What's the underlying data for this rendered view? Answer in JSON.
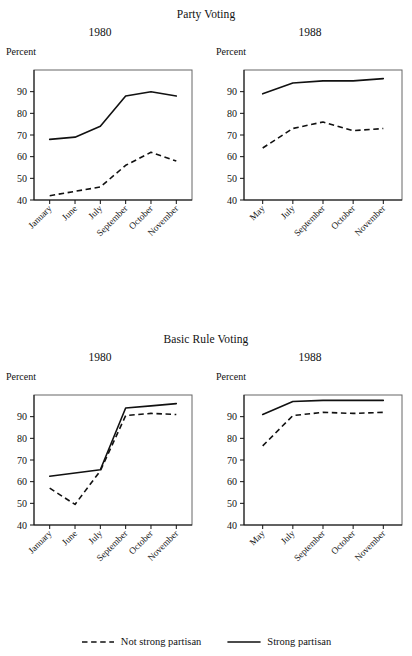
{
  "figure": {
    "panels": [
      {
        "title": "Party Voting",
        "charts": [
          {
            "year": "1980",
            "axis_label": "Percent"
          },
          {
            "year": "1988",
            "axis_label": "Percent"
          }
        ]
      },
      {
        "title": "Basic Rule Voting",
        "charts": [
          {
            "year": "1980",
            "axis_label": "Percent"
          },
          {
            "year": "1988",
            "axis_label": "Percent"
          }
        ]
      }
    ],
    "legend": {
      "items": [
        {
          "label": "Not strong partisan",
          "style": "dashed"
        },
        {
          "label": "Strong partisan",
          "style": "solid"
        }
      ]
    }
  },
  "chart_data": [
    {
      "id": "party-voting-1980",
      "type": "line",
      "title": "Party Voting",
      "subtitle": "1980",
      "xlabel": "",
      "ylabel": "Percent",
      "ylim": [
        40,
        100
      ],
      "yticks": [
        40,
        50,
        60,
        70,
        80,
        90
      ],
      "grid": false,
      "legend_position": "bottom-figure",
      "categories": [
        "January",
        "June",
        "July",
        "September",
        "October",
        "November"
      ],
      "series": [
        {
          "name": "Strong partisan",
          "style": "solid",
          "values": [
            68,
            69,
            74,
            88,
            90,
            88
          ]
        },
        {
          "name": "Not strong partisan",
          "style": "dashed",
          "values": [
            42,
            44,
            46,
            56,
            62,
            58
          ]
        }
      ]
    },
    {
      "id": "party-voting-1988",
      "type": "line",
      "title": "Party Voting",
      "subtitle": "1988",
      "xlabel": "",
      "ylabel": "Percent",
      "ylim": [
        40,
        100
      ],
      "yticks": [
        40,
        50,
        60,
        70,
        80,
        90
      ],
      "grid": false,
      "legend_position": "bottom-figure",
      "categories": [
        "May",
        "July",
        "September",
        "October",
        "November"
      ],
      "series": [
        {
          "name": "Strong partisan",
          "style": "solid",
          "values": [
            89,
            94,
            95,
            95,
            96
          ]
        },
        {
          "name": "Not strong partisan",
          "style": "dashed",
          "values": [
            64,
            73,
            76,
            72,
            73
          ]
        }
      ]
    },
    {
      "id": "basic-rule-voting-1980",
      "type": "line",
      "title": "Basic Rule Voting",
      "subtitle": "1980",
      "xlabel": "",
      "ylabel": "Percent",
      "ylim": [
        40,
        100
      ],
      "yticks": [
        40,
        50,
        60,
        70,
        80,
        90
      ],
      "grid": false,
      "legend_position": "bottom-figure",
      "categories": [
        "January",
        "June",
        "July",
        "September",
        "October",
        "November"
      ],
      "series": [
        {
          "name": "Strong partisan",
          "style": "solid",
          "values": [
            62.5,
            64,
            65.5,
            94,
            95,
            96
          ]
        },
        {
          "name": "Not strong partisan",
          "style": "dashed",
          "values": [
            57,
            49.5,
            65,
            90.5,
            91.5,
            91
          ]
        }
      ]
    },
    {
      "id": "basic-rule-voting-1988",
      "type": "line",
      "title": "Basic Rule Voting",
      "subtitle": "1988",
      "xlabel": "",
      "ylabel": "Percent",
      "ylim": [
        40,
        100
      ],
      "yticks": [
        40,
        50,
        60,
        70,
        80,
        90
      ],
      "grid": false,
      "legend_position": "bottom-figure",
      "categories": [
        "May",
        "July",
        "September",
        "October",
        "November"
      ],
      "series": [
        {
          "name": "Strong partisan",
          "style": "solid",
          "values": [
            91,
            97,
            97.5,
            97.5,
            97.5
          ]
        },
        {
          "name": "Not strong partisan",
          "style": "dashed",
          "values": [
            76.5,
            90.5,
            92,
            91.5,
            92
          ]
        }
      ]
    }
  ]
}
